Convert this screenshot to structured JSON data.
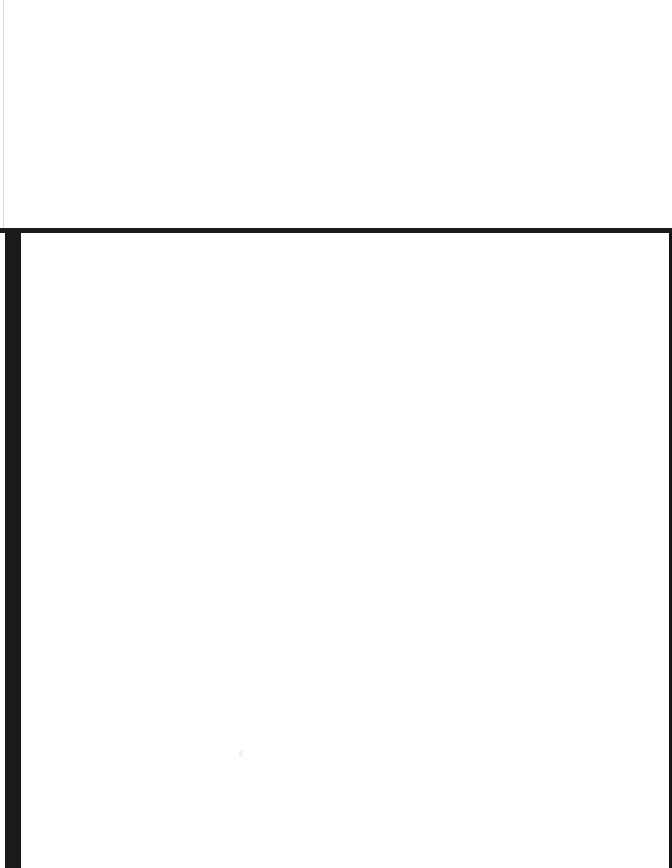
{
  "capture": {
    "width": 672,
    "height": 868,
    "state": "blank",
    "visible_text": "",
    "note": ""
  },
  "colors": {
    "page_background": "#ffffff",
    "panel_background": "#ffffff",
    "divider": "#1b1b1b",
    "left_edge_bar": "#1a1a1a",
    "right_edge_rule": "#141414",
    "upper_panel_left_rule": "#d9dadc",
    "artifact": "#f2f2f3"
  },
  "upper_panel": {
    "label": "",
    "content": ""
  },
  "lower_panel": {
    "label": "",
    "content": ""
  }
}
